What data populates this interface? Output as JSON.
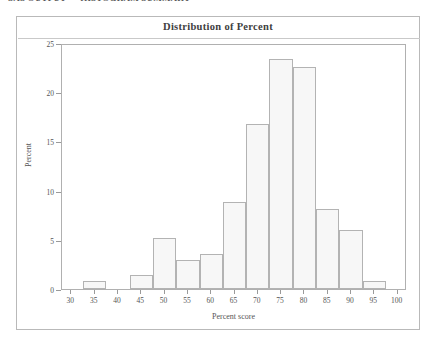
{
  "clipped_header_text": "SAS OUTPUT — HISTOGRAM SUMMARY",
  "chart_data": {
    "type": "bar",
    "title": "Distribution of Percent",
    "xlabel": "Percent score",
    "ylabel": "Percent",
    "categories": [
      35,
      40,
      45,
      50,
      55,
      60,
      65,
      70,
      75,
      80,
      85,
      90,
      95
    ],
    "values": [
      0.8,
      0,
      1.4,
      5.2,
      2.9,
      3.6,
      8.8,
      16.8,
      23.4,
      22.6,
      8.1,
      6.0,
      0.8
    ],
    "bar_width": 5,
    "xlim": [
      28,
      102
    ],
    "ylim": [
      0,
      25
    ],
    "xticks": [
      30,
      35,
      40,
      45,
      50,
      55,
      60,
      65,
      70,
      75,
      80,
      85,
      90,
      95,
      100
    ],
    "yticks": [
      0,
      5,
      10,
      15,
      20,
      25
    ],
    "grid": false,
    "legend": "none",
    "bar_fill_color": "#f7f7f7",
    "bar_border_color": "#b3b3b3",
    "axis_color": "#9a9a9a",
    "frame_color": "#b0b0b0",
    "title_color": "#404040",
    "background_color": "#ffffff"
  }
}
